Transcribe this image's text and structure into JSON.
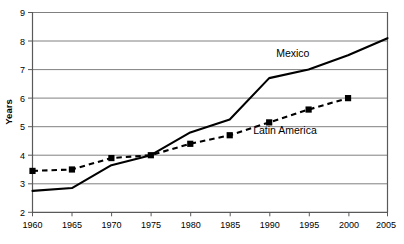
{
  "chart_data": {
    "type": "line",
    "title": "",
    "xlabel": "",
    "ylabel": "Years",
    "x": [
      1960,
      1965,
      1970,
      1975,
      1980,
      1985,
      1990,
      1995,
      2000,
      2005
    ],
    "xtick_labels": [
      "1960",
      "1965",
      "1970",
      "1975",
      "1980",
      "1985",
      "1990",
      "1995",
      "2000",
      "2005"
    ],
    "ytick_labels": [
      "2",
      "3",
      "4",
      "5",
      "6",
      "7",
      "8",
      "9"
    ],
    "xlim": [
      1960,
      2005
    ],
    "ylim": [
      2,
      9
    ],
    "grid": "horizontal",
    "legend_position": "inline-annotations",
    "series": [
      {
        "name": "Mexico",
        "style": "solid",
        "color": "#000000",
        "marker": "none",
        "x": [
          1960,
          1965,
          1970,
          1975,
          1980,
          1985,
          1990,
          1995,
          2000,
          2005
        ],
        "values": [
          2.75,
          2.85,
          3.65,
          4.0,
          4.8,
          5.25,
          6.7,
          7.0,
          7.5,
          8.1
        ]
      },
      {
        "name": "Latin America",
        "style": "dashed",
        "color": "#000000",
        "marker": "square",
        "x": [
          1960,
          1965,
          1970,
          1975,
          1980,
          1985,
          1990,
          1995,
          2000
        ],
        "values": [
          3.45,
          3.5,
          3.9,
          4.0,
          4.4,
          4.7,
          5.15,
          5.6,
          6.0
        ]
      }
    ],
    "annotations": [
      {
        "text": "Mexico",
        "x": 1993,
        "y": 7.45
      },
      {
        "text": "Latin America",
        "x": 1992,
        "y": 4.75
      }
    ]
  }
}
